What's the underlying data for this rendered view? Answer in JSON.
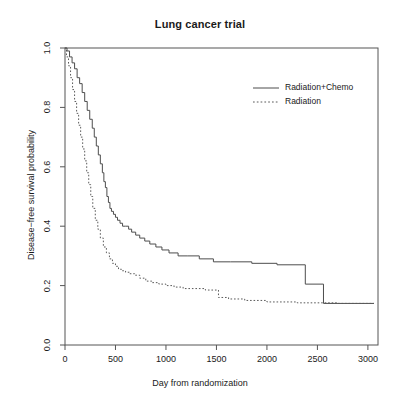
{
  "chart_data": {
    "type": "line",
    "subtype": "kaplan-meier-step",
    "title": "Lung cancer trial",
    "xlabel": "Day from randomization",
    "ylabel": "Disease−free survival probability",
    "xlim": [
      0,
      3100
    ],
    "ylim": [
      0.0,
      1.0
    ],
    "xticks": [
      0,
      500,
      1000,
      1500,
      2000,
      2500,
      3000
    ],
    "xtick_labels": [
      "0",
      "500",
      "1000",
      "1500",
      "2000",
      "2500",
      "3000"
    ],
    "yticks": [
      0.0,
      0.2,
      0.4,
      0.6,
      0.8,
      1.0
    ],
    "ytick_labels": [
      "0.0",
      "0.2",
      "0.4",
      "0.6",
      "0.8",
      "1.0"
    ],
    "grid": false,
    "legend_position": "top-right-inside",
    "box_frame": true,
    "series": [
      {
        "name": "Radiation+Chemo",
        "linestyle": "solid",
        "color": "#4d4d4d",
        "x": [
          0,
          20,
          45,
          70,
          95,
          120,
          145,
          170,
          195,
          220,
          245,
          270,
          290,
          310,
          330,
          350,
          370,
          385,
          400,
          415,
          430,
          445,
          460,
          480,
          500,
          520,
          545,
          570,
          600,
          630,
          660,
          700,
          740,
          790,
          840,
          900,
          960,
          1030,
          1120,
          1210,
          1330,
          1470,
          1640,
          1850,
          2100,
          2380,
          2560,
          3060
        ],
        "y": [
          1.0,
          0.99,
          0.97,
          0.95,
          0.93,
          0.9,
          0.88,
          0.85,
          0.82,
          0.79,
          0.76,
          0.73,
          0.7,
          0.67,
          0.64,
          0.61,
          0.58,
          0.55,
          0.53,
          0.5,
          0.48,
          0.46,
          0.45,
          0.44,
          0.43,
          0.42,
          0.41,
          0.4,
          0.4,
          0.39,
          0.38,
          0.37,
          0.36,
          0.35,
          0.34,
          0.33,
          0.32,
          0.31,
          0.3,
          0.3,
          0.29,
          0.28,
          0.28,
          0.275,
          0.27,
          0.205,
          0.14,
          0.14
        ]
      },
      {
        "name": "Radiation",
        "linestyle": "dotted",
        "color": "#5a5a5a",
        "x": [
          0,
          15,
          35,
          55,
          75,
          95,
          115,
          135,
          155,
          175,
          195,
          215,
          235,
          255,
          275,
          300,
          325,
          350,
          380,
          410,
          440,
          470,
          500,
          530,
          560,
          600,
          640,
          690,
          740,
          800,
          860,
          930,
          1000,
          1080,
          1170,
          1270,
          1390,
          1520,
          1620,
          1780,
          2000,
          2300,
          2700,
          3060
        ],
        "y": [
          1.0,
          0.97,
          0.94,
          0.9,
          0.86,
          0.82,
          0.78,
          0.74,
          0.7,
          0.66,
          0.62,
          0.58,
          0.54,
          0.5,
          0.46,
          0.42,
          0.39,
          0.36,
          0.33,
          0.31,
          0.29,
          0.275,
          0.265,
          0.255,
          0.25,
          0.245,
          0.24,
          0.235,
          0.225,
          0.215,
          0.21,
          0.205,
          0.2,
          0.195,
          0.19,
          0.19,
          0.185,
          0.16,
          0.155,
          0.15,
          0.145,
          0.142,
          0.14,
          0.14
        ]
      }
    ]
  },
  "legend": {
    "entries": [
      {
        "label": "Radiation+Chemo",
        "linestyle": "solid"
      },
      {
        "label": "Radiation",
        "linestyle": "dotted"
      }
    ]
  },
  "colors": {
    "background": "#ffffff",
    "axis": "#555555",
    "text": "#1a1a1a",
    "series_solid": "#4d4d4d",
    "series_dotted": "#5a5a5a"
  }
}
